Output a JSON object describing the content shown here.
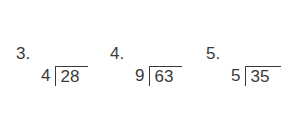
{
  "problems": [
    {
      "label": "3.",
      "divisor": "4",
      "dividend": "28"
    },
    {
      "label": "4.",
      "divisor": "9",
      "dividend": "63"
    },
    {
      "label": "5.",
      "divisor": "5",
      "dividend": "35"
    }
  ]
}
